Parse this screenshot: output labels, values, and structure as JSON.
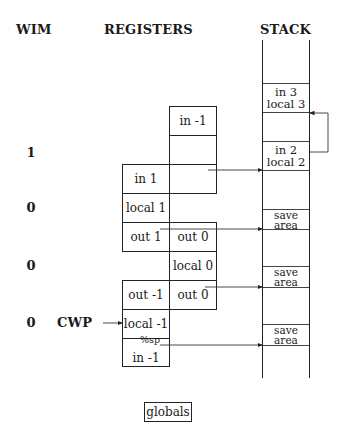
{
  "headers": {
    "wim": "WIM",
    "registers": "REGISTERS",
    "stack": "STACK"
  },
  "wim_bits": [
    "1",
    "0",
    "0",
    "0"
  ],
  "cwp_label": "CWP",
  "registers": {
    "window_col_b_top": [
      "in -1",
      "",
      ""
    ],
    "window_col_a_top": [
      "in 1",
      "local 1",
      "out 1"
    ],
    "window_col_b_mid": [
      "out 0",
      "local 0",
      "out 0"
    ],
    "window_col_a_bottom": [
      "out -1",
      "local -1",
      "in -1"
    ]
  },
  "sp_label": "%sp",
  "stack": {
    "frames": [
      {
        "line1": "in 3",
        "line2": "local 3"
      },
      {
        "line1": "in 2",
        "line2": "local 2"
      },
      {
        "line1": "save",
        "line2": "area"
      },
      {
        "line1": "save",
        "line2": "area"
      },
      {
        "line1": "save",
        "line2": "area"
      }
    ]
  },
  "globals_label": "globals",
  "colors": {
    "line": "#222222",
    "background": "#ffffff"
  }
}
